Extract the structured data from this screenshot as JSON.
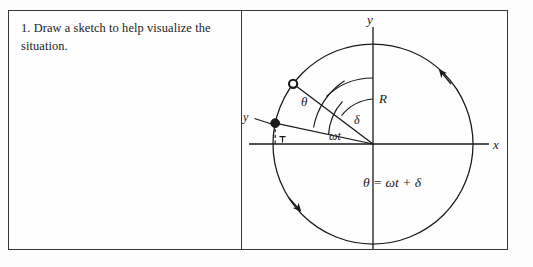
{
  "document": {
    "kind": "scanned-textbook-figure",
    "ink_color": "#19191b",
    "border_color": "#37373a",
    "page_color": "#fdfdfd"
  },
  "text_pane": {
    "prompt": "1.  Draw a sketch to help visualize the situation."
  },
  "figure": {
    "caption_equation": "θ = ωt + δ",
    "axis_labels": {
      "y": "y",
      "x": "x"
    },
    "angle_labels": {
      "theta": "θ",
      "omega_t": "ωt",
      "delta": "δ"
    },
    "radius_label": "R",
    "projection_label": "y",
    "markers": {
      "current_position": "open-circle-marker",
      "projected_position": "filled-dot-marker"
    },
    "rotation_direction": "counterclockwise",
    "geometry": {
      "center_x": 132,
      "center_y": 133,
      "radius": 100,
      "theta_degrees": 143,
      "omega_t_degrees": 168,
      "delta_degrees": 40
    }
  }
}
